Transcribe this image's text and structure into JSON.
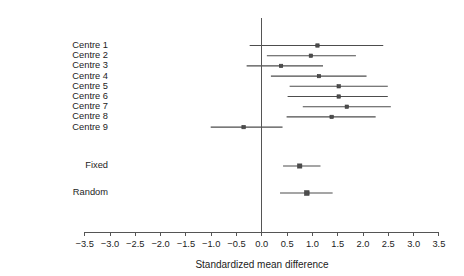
{
  "chart_data": {
    "type": "forest",
    "title": "",
    "xlabel": "Standardized mean difference",
    "ylabel": "",
    "xlim": [
      -3.5,
      3.5
    ],
    "xticks": [
      -3.5,
      -3.0,
      -2.5,
      -2.0,
      -1.5,
      -1.0,
      -0.5,
      0.0,
      0.5,
      1.0,
      1.5,
      2.0,
      2.5,
      3.0,
      3.5
    ],
    "xtick_labels": [
      "−3.5",
      "−3.0",
      "−2.5",
      "−2.0",
      "−1.5",
      "−1.0",
      "−0.5",
      "0.0",
      "0.5",
      "1.0",
      "1.5",
      "2.0",
      "2.5",
      "3.0",
      "3.5"
    ],
    "reference_line": 0.0,
    "grid": false,
    "legend": "none",
    "studies": [
      {
        "label": "Centre 1",
        "estimate": 1.1,
        "ci_low": -0.24,
        "ci_high": 2.4
      },
      {
        "label": "Centre 2",
        "estimate": 0.97,
        "ci_low": 0.1,
        "ci_high": 1.86
      },
      {
        "label": "Centre 3",
        "estimate": 0.38,
        "ci_low": -0.3,
        "ci_high": 1.21
      },
      {
        "label": "Centre 4",
        "estimate": 1.13,
        "ci_low": 0.18,
        "ci_high": 2.07
      },
      {
        "label": "Centre 5",
        "estimate": 1.52,
        "ci_low": 0.55,
        "ci_high": 2.49
      },
      {
        "label": "Centre 6",
        "estimate": 1.52,
        "ci_low": 0.51,
        "ci_high": 2.49
      },
      {
        "label": "Centre 7",
        "estimate": 1.68,
        "ci_low": 0.81,
        "ci_high": 2.55
      },
      {
        "label": "Centre 8",
        "estimate": 1.38,
        "ci_low": 0.49,
        "ci_high": 2.25
      },
      {
        "label": "Centre 9",
        "estimate": -0.36,
        "ci_low": -1.01,
        "ci_high": 0.41
      }
    ],
    "summaries": [
      {
        "label": "Fixed",
        "estimate": 0.75,
        "ci_low": 0.42,
        "ci_high": 1.16
      },
      {
        "label": "Random",
        "estimate": 0.89,
        "ci_low": 0.36,
        "ci_high": 1.4
      }
    ],
    "colors": {
      "line": "#4d4d4d",
      "marker": "#4d4d4d",
      "axis": "#555555",
      "text": "#1c1c1c",
      "background": "#ffffff"
    }
  }
}
